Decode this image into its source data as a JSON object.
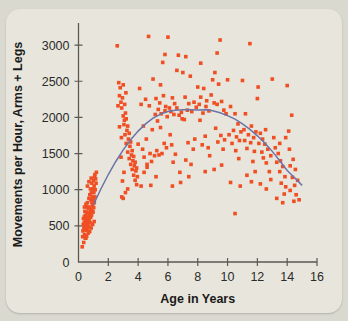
{
  "card": {
    "background_color": "#e8e6dc",
    "page_background_color": "#d9d9d0"
  },
  "chart_data": {
    "type": "scatter",
    "title": "",
    "subtitle": "",
    "xlabel": "Age in Years",
    "ylabel": "Movements per Hour, Arms + Legs",
    "xlim": [
      0,
      16
    ],
    "ylim": [
      0,
      3250
    ],
    "xticks": [
      0,
      2,
      4,
      6,
      8,
      10,
      12,
      14,
      16
    ],
    "xtick_labels": [
      "0",
      "2",
      "4",
      "6",
      "8",
      "10",
      "12",
      "14",
      "16"
    ],
    "yticks": [
      0,
      500,
      1000,
      1500,
      2000,
      2500,
      3000
    ],
    "ytick_labels": [
      "0",
      "500",
      "1000",
      "1500",
      "2000",
      "2500",
      "3000"
    ],
    "grid": false,
    "legend": "none",
    "marker": "square",
    "marker_color": "#f04e23",
    "marker_size_px": 3.6,
    "curve": {
      "name": "quadratic fit",
      "color": "#6b74a8",
      "type": "quadratic",
      "x_start": 1.0,
      "x_end": 15.0,
      "vertex_x": 8.6,
      "vertex_y": 2105,
      "coefficients": {
        "a": -13.4,
        "b": 230.5,
        "ingredient_c": 1113
      },
      "points": [
        [
          1.0,
          790
        ],
        [
          1.5,
          1010
        ],
        [
          2.0,
          1210
        ],
        [
          2.5,
          1390
        ],
        [
          3.0,
          1550
        ],
        [
          3.5,
          1690
        ],
        [
          4.0,
          1810
        ],
        [
          4.5,
          1910
        ],
        [
          5.0,
          1990
        ],
        [
          5.5,
          2045
        ],
        [
          6.0,
          2080
        ],
        [
          6.5,
          2098
        ],
        [
          7.0,
          2105
        ],
        [
          7.5,
          2105
        ],
        [
          8.0,
          2103
        ],
        [
          8.6,
          2105
        ],
        [
          9.0,
          2092
        ],
        [
          9.5,
          2065
        ],
        [
          10.0,
          2025
        ],
        [
          10.5,
          1975
        ],
        [
          11.0,
          1910
        ],
        [
          11.5,
          1835
        ],
        [
          12.0,
          1745
        ],
        [
          12.5,
          1645
        ],
        [
          13.0,
          1530
        ],
        [
          13.5,
          1400
        ],
        [
          14.0,
          1265
        ],
        [
          14.5,
          1165
        ],
        [
          15.0,
          1060
        ]
      ]
    },
    "points": [
      [
        0.25,
        210
      ],
      [
        0.28,
        350
      ],
      [
        0.3,
        430
      ],
      [
        0.32,
        520
      ],
      [
        0.33,
        600
      ],
      [
        0.35,
        270
      ],
      [
        0.36,
        470
      ],
      [
        0.38,
        540
      ],
      [
        0.4,
        380
      ],
      [
        0.4,
        630
      ],
      [
        0.42,
        500
      ],
      [
        0.43,
        700
      ],
      [
        0.45,
        450
      ],
      [
        0.46,
        560
      ],
      [
        0.48,
        640
      ],
      [
        0.5,
        330
      ],
      [
        0.5,
        520
      ],
      [
        0.52,
        590
      ],
      [
        0.53,
        690
      ],
      [
        0.55,
        440
      ],
      [
        0.56,
        760
      ],
      [
        0.58,
        510
      ],
      [
        0.6,
        600
      ],
      [
        0.6,
        820
      ],
      [
        0.62,
        470
      ],
      [
        0.63,
        680
      ],
      [
        0.65,
        550
      ],
      [
        0.66,
        740
      ],
      [
        0.68,
        620
      ],
      [
        0.7,
        490
      ],
      [
        0.7,
        880
      ],
      [
        0.72,
        660
      ],
      [
        0.73,
        580
      ],
      [
        0.75,
        760
      ],
      [
        0.76,
        930
      ],
      [
        0.78,
        540
      ],
      [
        0.8,
        700
      ],
      [
        0.8,
        1010
      ],
      [
        0.82,
        620
      ],
      [
        0.83,
        860
      ],
      [
        0.85,
        730
      ],
      [
        0.86,
        960
      ],
      [
        0.88,
        650
      ],
      [
        0.9,
        820
      ],
      [
        0.9,
        1090
      ],
      [
        0.92,
        700
      ],
      [
        0.93,
        900
      ],
      [
        0.95,
        780
      ],
      [
        0.96,
        1010
      ],
      [
        0.98,
        690
      ],
      [
        1.0,
        860
      ],
      [
        1.0,
        1130
      ],
      [
        1.02,
        750
      ],
      [
        1.03,
        960
      ],
      [
        1.05,
        1050
      ],
      [
        1.06,
        820
      ],
      [
        1.08,
        1180
      ],
      [
        1.1,
        900
      ],
      [
        1.1,
        1210
      ],
      [
        1.12,
        1000
      ],
      [
        1.15,
        1150
      ],
      [
        1.18,
        1090
      ],
      [
        1.2,
        1240
      ],
      [
        0.45,
        330
      ],
      [
        0.55,
        360
      ],
      [
        0.65,
        400
      ],
      [
        0.75,
        420
      ],
      [
        0.85,
        470
      ],
      [
        0.95,
        520
      ],
      [
        1.05,
        560
      ],
      [
        0.4,
        760
      ],
      [
        0.5,
        800
      ],
      [
        0.6,
        1050
      ],
      [
        0.7,
        1110
      ],
      [
        0.85,
        1160
      ],
      [
        2.6,
        2990
      ],
      [
        2.7,
        2480
      ],
      [
        2.75,
        2300
      ],
      [
        2.8,
        2410
      ],
      [
        2.85,
        2210
      ],
      [
        2.9,
        2130
      ],
      [
        2.95,
        2270
      ],
      [
        3.0,
        2020
      ],
      [
        3.0,
        2450
      ],
      [
        3.05,
        1900
      ],
      [
        3.1,
        2180
      ],
      [
        3.12,
        1760
      ],
      [
        3.15,
        2060
      ],
      [
        3.2,
        1640
      ],
      [
        3.2,
        1980
      ],
      [
        3.25,
        1820
      ],
      [
        3.3,
        1520
      ],
      [
        3.3,
        1880
      ],
      [
        3.35,
        1700
      ],
      [
        3.4,
        1430
      ],
      [
        3.4,
        1780
      ],
      [
        3.45,
        1600
      ],
      [
        3.5,
        1350
      ],
      [
        3.5,
        1660
      ],
      [
        3.55,
        1480
      ],
      [
        3.6,
        1280
      ],
      [
        3.6,
        1540
      ],
      [
        3.65,
        1400
      ],
      [
        3.7,
        1200
      ],
      [
        3.7,
        1460
      ],
      [
        3.75,
        1330
      ],
      [
        3.8,
        1130
      ],
      [
        3.8,
        1380
      ],
      [
        3.85,
        1260
      ],
      [
        3.9,
        1070
      ],
      [
        3.9,
        1300
      ],
      [
        3.95,
        1180
      ],
      [
        2.9,
        900
      ],
      [
        3.0,
        880
      ],
      [
        3.15,
        960
      ],
      [
        3.3,
        1010
      ],
      [
        2.95,
        1120
      ],
      [
        3.05,
        1240
      ],
      [
        2.85,
        1450
      ],
      [
        2.88,
        1720
      ],
      [
        3.08,
        1960
      ],
      [
        3.18,
        2340
      ],
      [
        2.75,
        1870
      ],
      [
        2.65,
        2160
      ],
      [
        4.1,
        2400
      ],
      [
        4.2,
        2180
      ],
      [
        4.3,
        1560
      ],
      [
        4.35,
        1880
      ],
      [
        4.4,
        1450
      ],
      [
        4.5,
        2250
      ],
      [
        4.55,
        1700
      ],
      [
        4.6,
        1350
      ],
      [
        4.7,
        3120
      ],
      [
        4.75,
        2160
      ],
      [
        4.8,
        1500
      ],
      [
        4.85,
        1060
      ],
      [
        4.9,
        1390
      ],
      [
        4.95,
        1830
      ],
      [
        4.2,
        1050
      ],
      [
        4.4,
        1240
      ],
      [
        4.6,
        1310
      ],
      [
        4.0,
        1630
      ],
      [
        5.0,
        2530
      ],
      [
        5.1,
        1470
      ],
      [
        5.15,
        2040
      ],
      [
        5.2,
        2260
      ],
      [
        5.25,
        1540
      ],
      [
        5.3,
        1950
      ],
      [
        5.35,
        2110
      ],
      [
        5.4,
        1480
      ],
      [
        5.45,
        2200
      ],
      [
        5.5,
        1860
      ],
      [
        5.55,
        2050
      ],
      [
        5.6,
        1500
      ],
      [
        5.65,
        2760
      ],
      [
        5.7,
        2300
      ],
      [
        5.75,
        1640
      ],
      [
        5.8,
        2090
      ],
      [
        5.85,
        2150
      ],
      [
        5.9,
        1580
      ],
      [
        5.95,
        2010
      ],
      [
        5.2,
        1180
      ],
      [
        5.5,
        2450
      ],
      [
        5.8,
        2870
      ],
      [
        6.0,
        3110
      ],
      [
        6.1,
        2130
      ],
      [
        6.2,
        2080
      ],
      [
        6.25,
        1620
      ],
      [
        6.3,
        2270
      ],
      [
        6.35,
        1380
      ],
      [
        6.4,
        2040
      ],
      [
        6.45,
        2190
      ],
      [
        6.5,
        1490
      ],
      [
        6.6,
        2130
      ],
      [
        6.7,
        2860
      ],
      [
        6.75,
        2030
      ],
      [
        6.8,
        1240
      ],
      [
        6.85,
        1100
      ],
      [
        6.9,
        2070
      ],
      [
        6.95,
        1980
      ],
      [
        6.3,
        1050
      ],
      [
        6.6,
        2650
      ],
      [
        6.15,
        1760
      ],
      [
        7.0,
        2620
      ],
      [
        7.1,
        1970
      ],
      [
        7.15,
        2280
      ],
      [
        7.2,
        1410
      ],
      [
        7.3,
        2100
      ],
      [
        7.35,
        1650
      ],
      [
        7.4,
        2190
      ],
      [
        7.5,
        2570
      ],
      [
        7.55,
        1350
      ],
      [
        7.6,
        2080
      ],
      [
        7.7,
        1560
      ],
      [
        7.75,
        2210
      ],
      [
        7.8,
        1700
      ],
      [
        7.9,
        2140
      ],
      [
        7.4,
        1180
      ],
      [
        7.2,
        2840
      ],
      [
        8.0,
        2420
      ],
      [
        8.1,
        2180
      ],
      [
        8.15,
        1960
      ],
      [
        8.2,
        2280
      ],
      [
        8.3,
        1620
      ],
      [
        8.35,
        2060
      ],
      [
        8.4,
        2400
      ],
      [
        8.5,
        1740
      ],
      [
        8.55,
        2150
      ],
      [
        8.6,
        2230
      ],
      [
        8.7,
        1580
      ],
      [
        8.75,
        2090
      ],
      [
        8.8,
        1470
      ],
      [
        8.9,
        2310
      ],
      [
        8.5,
        1250
      ],
      [
        8.2,
        2750
      ],
      [
        9.0,
        2520
      ],
      [
        9.1,
        2200
      ],
      [
        9.15,
        2620
      ],
      [
        9.2,
        1850
      ],
      [
        9.3,
        2180
      ],
      [
        9.35,
        1660
      ],
      [
        9.4,
        2460
      ],
      [
        9.5,
        3070
      ],
      [
        9.55,
        1750
      ],
      [
        9.6,
        2220
      ],
      [
        9.7,
        1560
      ],
      [
        9.75,
        2100
      ],
      [
        9.8,
        1690
      ],
      [
        9.9,
        2050
      ],
      [
        9.3,
        2890
      ],
      [
        9.1,
        1280
      ],
      [
        9.6,
        1340
      ],
      [
        10.0,
        2520
      ],
      [
        10.1,
        1760
      ],
      [
        10.2,
        2150
      ],
      [
        10.3,
        1640
      ],
      [
        10.4,
        1820
      ],
      [
        10.5,
        2050
      ],
      [
        10.55,
        1540
      ],
      [
        10.6,
        1730
      ],
      [
        10.7,
        1910
      ],
      [
        10.75,
        1430
      ],
      [
        10.8,
        1680
      ],
      [
        10.9,
        1800
      ],
      [
        10.5,
        670
      ],
      [
        10.2,
        1100
      ],
      [
        10.85,
        1050
      ],
      [
        11.0,
        2510
      ],
      [
        11.1,
        1830
      ],
      [
        11.15,
        1680
      ],
      [
        11.2,
        2050
      ],
      [
        11.3,
        1570
      ],
      [
        11.4,
        1760
      ],
      [
        11.5,
        3020
      ],
      [
        11.55,
        1650
      ],
      [
        11.6,
        1880
      ],
      [
        11.7,
        1390
      ],
      [
        11.75,
        1720
      ],
      [
        11.8,
        1530
      ],
      [
        11.9,
        1800
      ],
      [
        11.3,
        1200
      ],
      [
        11.6,
        1110
      ],
      [
        11.85,
        1250
      ],
      [
        12.0,
        2260
      ],
      [
        12.05,
        2420
      ],
      [
        12.1,
        1640
      ],
      [
        12.2,
        1780
      ],
      [
        12.3,
        1520
      ],
      [
        12.35,
        1700
      ],
      [
        12.4,
        1440
      ],
      [
        12.5,
        1630
      ],
      [
        12.55,
        1830
      ],
      [
        12.6,
        1370
      ],
      [
        12.7,
        1560
      ],
      [
        12.8,
        1250
      ],
      [
        12.9,
        1470
      ],
      [
        12.2,
        1080
      ],
      [
        12.6,
        1010
      ],
      [
        12.9,
        1140
      ],
      [
        13.0,
        2530
      ],
      [
        13.1,
        1720
      ],
      [
        13.2,
        1580
      ],
      [
        13.3,
        1380
      ],
      [
        13.4,
        1500
      ],
      [
        13.5,
        1250
      ],
      [
        13.55,
        1400
      ],
      [
        13.6,
        1090
      ],
      [
        13.7,
        1320
      ],
      [
        13.8,
        940
      ],
      [
        13.85,
        1180
      ],
      [
        13.9,
        1040
      ],
      [
        13.3,
        880
      ],
      [
        13.7,
        820
      ],
      [
        13.5,
        1640
      ],
      [
        13.9,
        1720
      ],
      [
        14.0,
        2440
      ],
      [
        14.1,
        1810
      ],
      [
        14.15,
        1560
      ],
      [
        14.2,
        1330
      ],
      [
        14.3,
        2030
      ],
      [
        14.35,
        1170
      ],
      [
        14.4,
        1420
      ],
      [
        14.5,
        1060
      ],
      [
        14.55,
        1280
      ],
      [
        14.6,
        930
      ],
      [
        14.7,
        1130
      ],
      [
        14.8,
        860
      ],
      [
        14.2,
        990
      ],
      [
        14.45,
        840
      ]
    ]
  }
}
